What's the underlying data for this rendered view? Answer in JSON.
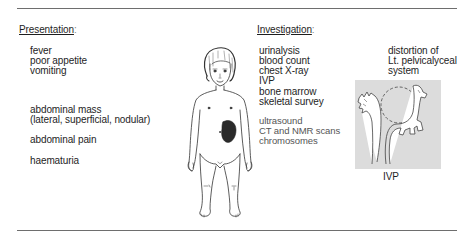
{
  "presentation": {
    "heading": "Presentation",
    "colon": ":",
    "items": [
      "fever",
      "poor appetite",
      "vomiting",
      "abdominal mass",
      "(lateral, superficial, nodular)",
      "abdominal pain",
      "haematuria"
    ]
  },
  "figure": {
    "mass_color": "#2a2a2a"
  },
  "investigation": {
    "heading": "Investigation",
    "colon": ":",
    "primary_items": [
      "urinalysis",
      "blood count",
      "chest X-ray",
      "IVP",
      "bone marrow",
      "skeletal survey"
    ],
    "secondary_items": [
      "ultrasound",
      "CT and NMR scans",
      "chromosomes"
    ]
  },
  "ivp_image": {
    "annotation_lines": [
      "distortion of",
      "Lt. pelvicalyceal",
      "system"
    ],
    "caption": "IVP",
    "background_color": "#dcdcdc"
  }
}
